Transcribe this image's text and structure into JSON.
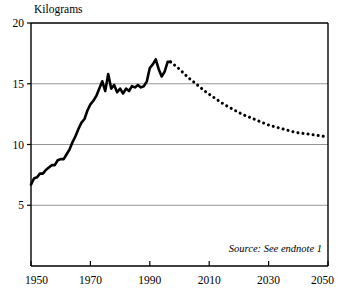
{
  "chart_data": {
    "type": "line",
    "title": "Kilograms",
    "xlabel": "",
    "ylabel": "Kilograms",
    "xlim": [
      1950,
      2050
    ],
    "ylim": [
      0,
      20
    ],
    "grid": true,
    "legend": false,
    "yticks": [
      5,
      10,
      15,
      20
    ],
    "ytick_labels": [
      "5",
      "10",
      "15",
      "20"
    ],
    "xticks": [
      1950,
      1970,
      1990,
      2010,
      2030,
      2050
    ],
    "xtick_labels": [
      "1950",
      "1970",
      "1990",
      "2010",
      "2030",
      "2050"
    ],
    "annotations": [
      {
        "text": "Source: See endnote 1",
        "x": 2030,
        "y": 2.2,
        "style": "italic"
      }
    ],
    "series": [
      {
        "name": "Historical",
        "style": "solid",
        "x": [
          1950,
          1951,
          1952,
          1953,
          1954,
          1955,
          1956,
          1957,
          1958,
          1959,
          1960,
          1961,
          1962,
          1963,
          1964,
          1965,
          1966,
          1967,
          1968,
          1969,
          1970,
          1971,
          1972,
          1973,
          1974,
          1975,
          1976,
          1977,
          1978,
          1979,
          1980,
          1981,
          1982,
          1983,
          1984,
          1985,
          1986,
          1987,
          1988,
          1989,
          1990,
          1991,
          1992,
          1993,
          1994,
          1995,
          1996,
          1997
        ],
        "values": [
          6.7,
          7.2,
          7.3,
          7.6,
          7.6,
          7.9,
          8.1,
          8.3,
          8.3,
          8.7,
          8.8,
          8.8,
          9.2,
          9.6,
          10.2,
          10.7,
          11.3,
          11.8,
          12.1,
          12.8,
          13.3,
          13.6,
          14.0,
          14.6,
          15.2,
          14.4,
          15.8,
          14.6,
          14.9,
          14.3,
          14.6,
          14.2,
          14.6,
          14.4,
          14.8,
          14.7,
          14.9,
          14.7,
          14.8,
          15.2,
          16.3,
          16.6,
          17.0,
          16.2,
          15.6,
          16.0,
          16.8,
          16.8
        ]
      },
      {
        "name": "Projection",
        "style": "dotted",
        "x": [
          1997,
          2000,
          2003,
          2006,
          2009,
          2012,
          2015,
          2018,
          2021,
          2024,
          2027,
          2030,
          2033,
          2036,
          2039,
          2042,
          2045,
          2048,
          2050
        ],
        "values": [
          16.8,
          16.2,
          15.5,
          14.9,
          14.3,
          13.8,
          13.3,
          12.9,
          12.5,
          12.2,
          11.9,
          11.6,
          11.4,
          11.2,
          11.0,
          10.9,
          10.8,
          10.7,
          10.6
        ]
      }
    ]
  },
  "colors": {
    "line": "#000000",
    "grid": "#8a8a8a",
    "frame": "#000000",
    "background": "#ffffff"
  }
}
